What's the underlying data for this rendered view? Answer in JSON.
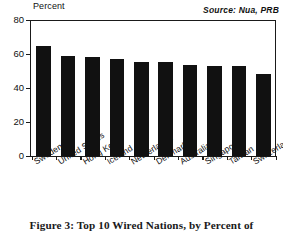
{
  "chart_data": {
    "type": "bar",
    "title": "",
    "xlabel": "",
    "ylabel": "Percent",
    "ylim": [
      0,
      80
    ],
    "yticks": [
      0,
      20,
      40,
      60,
      80
    ],
    "grid": false,
    "legend": "none",
    "annotation": "Source: Nua, PRB",
    "categories": [
      "Sweden",
      "United States",
      "Hong Kong",
      "Iceland",
      "Netherlands",
      "Denmark",
      "Australia",
      "Singapore",
      "Taiwan",
      "Switzerland"
    ],
    "values": [
      64.5,
      59,
      58,
      57,
      55.5,
      55.5,
      53.5,
      53,
      53,
      48
    ],
    "bar_color": "#111111"
  },
  "caption": {
    "text": "Figure 3: Top 10 Wired Nations, by Percent of"
  }
}
